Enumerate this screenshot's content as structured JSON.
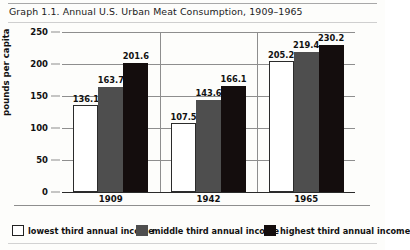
{
  "chart_data": {
    "type": "bar",
    "title": "Graph 1.1. Annual U.S. Urban Meat Consumption, 1909–1965",
    "xlabel": "",
    "ylabel": "pounds per capita",
    "categories": [
      "1909",
      "1942",
      "1965"
    ],
    "series": [
      {
        "name": "lowest third annual income",
        "color": "#ffffff",
        "values": [
          136.1,
          107.5,
          205.2
        ]
      },
      {
        "name": "middle third annual income",
        "color": "#4e4e4e",
        "values": [
          163.7,
          143.6,
          219.4
        ]
      },
      {
        "name": "highest third annual income",
        "color": "#140d0d",
        "values": [
          201.6,
          166.1,
          230.2
        ]
      }
    ],
    "ylim": [
      0,
      250
    ],
    "yticks": [
      0,
      50,
      100,
      150,
      200,
      250
    ],
    "ytick_labels": [
      "0",
      "50",
      "100",
      "150",
      "200",
      "250"
    ],
    "grid": true,
    "legend_position": "bottom"
  },
  "legend": {
    "items": [
      {
        "label": "lowest third annual income"
      },
      {
        "label": "middle third annual income"
      },
      {
        "label": "highest third annual income"
      }
    ]
  }
}
